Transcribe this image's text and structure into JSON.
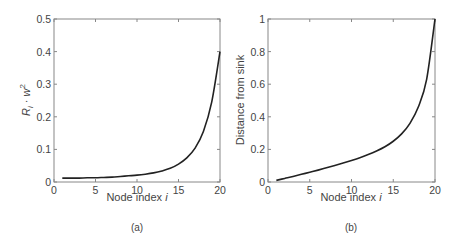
{
  "chart_data": [
    {
      "type": "line",
      "panel": "(a)",
      "title": "",
      "xlabel": "Node index i",
      "ylabel": "R_i · w_i^2",
      "xlim": [
        0,
        20
      ],
      "ylim": [
        0,
        0.5
      ],
      "xticks": [
        0,
        5,
        10,
        15,
        20
      ],
      "yticks": [
        0,
        0.1,
        0.2,
        0.3,
        0.4,
        0.5
      ],
      "grid": false,
      "x": [
        1,
        2,
        3,
        4,
        5,
        6,
        7,
        8,
        9,
        10,
        11,
        12,
        13,
        14,
        15,
        16,
        17,
        18,
        19,
        20
      ],
      "series": [
        {
          "name": "R_i · w_i^2",
          "values": [
            0.012,
            0.012,
            0.012,
            0.013,
            0.013,
            0.014,
            0.015,
            0.017,
            0.019,
            0.021,
            0.024,
            0.028,
            0.034,
            0.042,
            0.055,
            0.074,
            0.104,
            0.155,
            0.245,
            0.4
          ]
        }
      ]
    },
    {
      "type": "line",
      "panel": "(b)",
      "title": "",
      "xlabel": "Node index i",
      "ylabel": "Distance from sink",
      "xlim": [
        0,
        20
      ],
      "ylim": [
        0,
        1
      ],
      "xticks": [
        0,
        5,
        10,
        15,
        20
      ],
      "yticks": [
        0,
        0.2,
        0.4,
        0.6,
        0.8,
        1
      ],
      "grid": false,
      "x": [
        1,
        2,
        3,
        4,
        5,
        6,
        7,
        8,
        9,
        10,
        11,
        12,
        13,
        14,
        15,
        16,
        17,
        18,
        19,
        20
      ],
      "series": [
        {
          "name": "Distance from sink",
          "values": [
            0.01,
            0.022,
            0.034,
            0.047,
            0.06,
            0.073,
            0.087,
            0.101,
            0.116,
            0.132,
            0.149,
            0.168,
            0.19,
            0.216,
            0.25,
            0.295,
            0.36,
            0.46,
            0.63,
            1.0
          ]
        }
      ]
    }
  ],
  "panels": {
    "a": {
      "caption": "(a)",
      "xlabel_text": "Node index ",
      "xlabel_var": "i",
      "ylabel_R": "R",
      "ylabel_sub": "i",
      "ylabel_dot": " · ",
      "ylabel_w": "w",
      "ylabel_sup": "2",
      "xticks": [
        "0",
        "5",
        "10",
        "15",
        "20"
      ],
      "yticks": [
        "0",
        "0.1",
        "0.2",
        "0.3",
        "0.4",
        "0.5"
      ]
    },
    "b": {
      "caption": "(b)",
      "xlabel_text": "Node index ",
      "xlabel_var": "i",
      "ylabel": "Distance from sink",
      "xticks": [
        "0",
        "5",
        "10",
        "15",
        "20"
      ],
      "yticks": [
        "0",
        "0.2",
        "0.4",
        "0.6",
        "0.8",
        "1"
      ]
    }
  },
  "colors": {
    "line": "#222222",
    "axis": "#777777",
    "text": "#444444"
  }
}
